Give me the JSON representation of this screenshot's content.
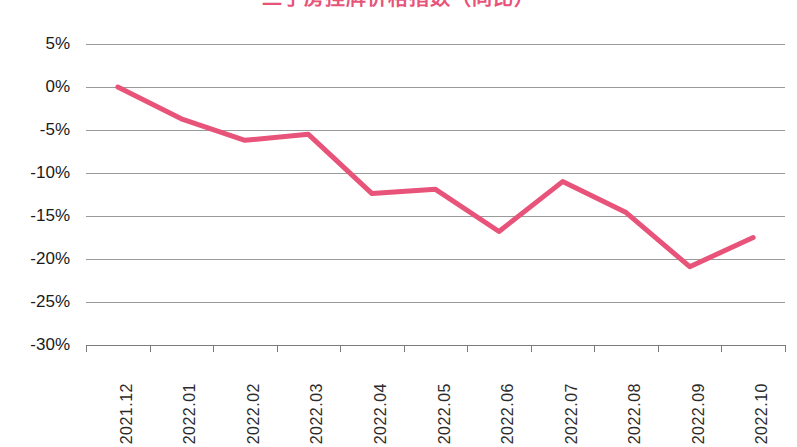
{
  "chart_data": {
    "type": "line",
    "title": "二手房挂牌价格指数（同比）",
    "subtitle": "",
    "xlabel": "",
    "ylabel": "",
    "categories": [
      "2021.12",
      "2022.01",
      "2022.02",
      "2022.03",
      "2022.04",
      "2022.05",
      "2022.06",
      "2022.07",
      "2022.08",
      "2022.09",
      "2022.10"
    ],
    "values": [
      0.0,
      -3.7,
      -6.2,
      -5.5,
      -12.4,
      -11.9,
      -16.8,
      -11.0,
      -14.6,
      -20.9,
      -17.5
    ],
    "series": [
      {
        "name": "二手房挂牌价格指数",
        "values": [
          0.0,
          -3.7,
          -6.2,
          -5.5,
          -12.4,
          -11.9,
          -16.8,
          -11.0,
          -14.6,
          -20.9,
          -17.5
        ],
        "color": "#e8537a"
      }
    ],
    "y_ticks": [
      5,
      0,
      -5,
      -10,
      -15,
      -20,
      -25,
      -30
    ],
    "y_tick_labels": [
      "5%",
      "0%",
      "-5%",
      "-10%",
      "-15%",
      "-20%",
      "-25%",
      "-30%"
    ],
    "ylim": [
      -30,
      5
    ],
    "grid": true,
    "grid_axis": "y",
    "legend": false,
    "legend_position": "none",
    "value_format": "percent",
    "markers": false,
    "line_width": 5
  },
  "axes": {
    "y_tick_labels": [
      "5%",
      "0%",
      "-5%",
      "-10%",
      "-15%",
      "-20%",
      "-25%",
      "-30%"
    ],
    "x_tick_labels": [
      "2021.12",
      "2022.01",
      "2022.02",
      "2022.03",
      "2022.04",
      "2022.05",
      "2022.06",
      "2022.07",
      "2022.08",
      "2022.09",
      "2022.10"
    ]
  },
  "colors": {
    "line": "#e8537a",
    "grid": "#9a9a9a",
    "axis": "#7a7a7a",
    "text": "#1a1a1a",
    "background": "#ffffff"
  }
}
